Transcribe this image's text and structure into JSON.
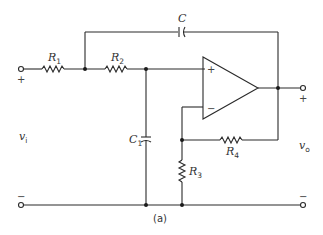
{
  "figure": {
    "caption": "(a)",
    "line_color": "#2a2a2a",
    "background": "#ffffff"
  },
  "components": {
    "R1": {
      "label": "R",
      "sub": "1"
    },
    "R2": {
      "label": "R",
      "sub": "2"
    },
    "R3": {
      "label": "R",
      "sub": "3"
    },
    "R4": {
      "label": "R",
      "sub": "4"
    },
    "C": {
      "label": "C"
    },
    "C1": {
      "label": "C",
      "sub": "1"
    }
  },
  "opamp": {
    "plus": "+",
    "minus": "−"
  },
  "ports": {
    "input": {
      "label": "v",
      "sub": "i",
      "top_sign": "+",
      "bottom_sign": "−"
    },
    "output": {
      "label": "v",
      "sub": "o",
      "top_sign": "+",
      "bottom_sign": "−"
    }
  }
}
